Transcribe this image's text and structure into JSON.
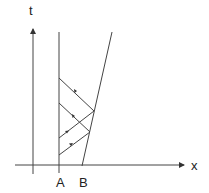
{
  "diagram": {
    "axes": {
      "x_label": "x",
      "y_label": "t"
    },
    "markers": {
      "a_label": "A",
      "b_label": "B"
    },
    "colors": {
      "stroke": "#333333",
      "background": "#ffffff"
    }
  }
}
